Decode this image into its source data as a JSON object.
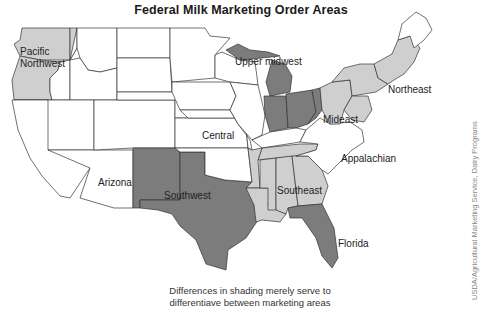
{
  "title": "Federal Milk Marketing Order Areas",
  "caption": {
    "line1": "Differences in shading merely serve to",
    "line2": "differentiave between marketing areas"
  },
  "credit": "USDA/Agricultural Marketing Service, Dairy Programs",
  "regions": {
    "pacific_northwest": {
      "line1": "Pacific",
      "line2": "Northwest",
      "shade": "light"
    },
    "upper_midwest": {
      "label": "Upper midwest",
      "shade": "white"
    },
    "central": {
      "label": "Central",
      "shade": "white"
    },
    "arizona": {
      "label": "Arizona",
      "shade": "white"
    },
    "southwest": {
      "label": "Southwest",
      "shade": "dark"
    },
    "mideast": {
      "label": "Mideast",
      "shade": "dark"
    },
    "northeast": {
      "label": "Northeast",
      "shade": "light"
    },
    "appalachian": {
      "label": "Appalachian",
      "shade": "white"
    },
    "southeast": {
      "label": "Southeast",
      "shade": "light"
    },
    "florida": {
      "label": "Florida",
      "shade": "dark"
    }
  },
  "colors": {
    "white": "#ffffff",
    "light": "#cfcfcf",
    "dark": "#7c7c7c",
    "border": "#333333"
  }
}
